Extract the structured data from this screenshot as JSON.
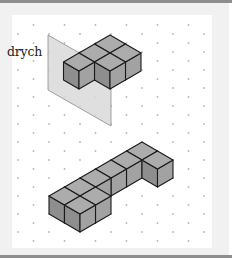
{
  "labels": {
    "mirror": "drych"
  },
  "colors": {
    "top_bar": "#8e8e8e",
    "card_background": "#f1f1f1",
    "panel_background": "#ffffff",
    "dot": "#b8b8b8",
    "mirror_fill": "#d9d9d9",
    "mirror_stroke": "#8a8a8a",
    "cube_top": "#acacac",
    "cube_left": "#8e8e8e",
    "cube_right": "#a2a2a2",
    "cube_edge": "#1a1a1a"
  },
  "isometric_grid": {
    "column_spacing_px": 15.5,
    "row_offset_px": 9,
    "vertical_spacing_px": 18
  },
  "figures": [
    {
      "name": "top-shape",
      "description": "Five-cube shape placed against the mirror",
      "cube_count": 5,
      "anchor_top_vertex": [
        110,
        35
      ],
      "cells": [
        [
          0,
          0
        ],
        [
          1,
          0
        ],
        [
          0,
          1
        ],
        [
          1,
          1
        ],
        [
          0,
          2
        ]
      ]
    },
    {
      "name": "bottom-shape",
      "description": "Nine-cube shape (reflection candidate)",
      "cube_count": 9,
      "anchor_top_vertex": [
        142,
        142
      ],
      "cells": [
        [
          0,
          0
        ],
        [
          0,
          1
        ],
        [
          0,
          2
        ],
        [
          0,
          3
        ],
        [
          0,
          4
        ],
        [
          0,
          5
        ],
        [
          1,
          0
        ],
        [
          1,
          4
        ],
        [
          1,
          5
        ]
      ]
    }
  ]
}
